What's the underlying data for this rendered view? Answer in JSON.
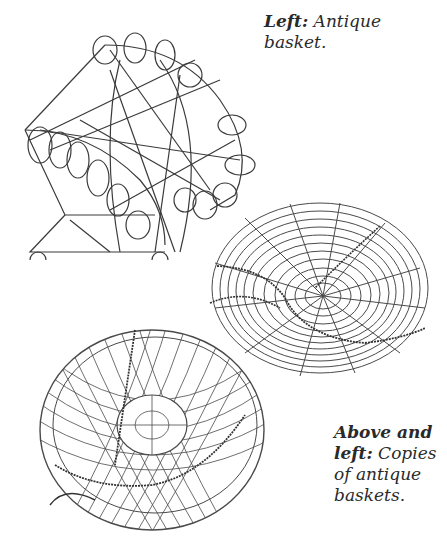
{
  "captions": {
    "top": {
      "label": "Left:",
      "text": " Antique basket."
    },
    "bottom": {
      "label_line1": "Above and",
      "label_line2": "left:",
      "text_line2": " Copies",
      "text_line3": "of antique",
      "text_line4": "baskets."
    }
  },
  "figures": [
    {
      "name": "antique-wire-basket",
      "description": "Antique wire basket with looped rim"
    },
    {
      "name": "round-wire-bowl-basket",
      "description": "Round wire basket with concentric rings"
    },
    {
      "name": "mesh-wire-basket",
      "description": "Wire mesh basket with lattice weave"
    }
  ],
  "colors": {
    "ink": "#3a3a3a",
    "paper": "#ffffff"
  }
}
